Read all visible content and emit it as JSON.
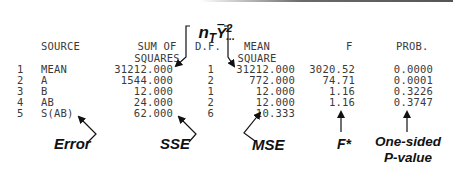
{
  "formula_annotation": {
    "text_main": "n",
    "subscript": "T",
    "y": "Y",
    "superscript": "2",
    "dots": "..."
  },
  "table": {
    "headers": {
      "source": "SOURCE",
      "ss_line1": "SUM OF",
      "ss_line2": "SQUARES",
      "df": "D.F.",
      "ms_line1": "MEAN",
      "ms_line2": "SQUARE",
      "f": "F",
      "prob": "PROB."
    },
    "rows": [
      {
        "num": "1",
        "source": "MEAN",
        "ss": "31212.000",
        "df": "1",
        "ms": "31212.000",
        "f": "3020.52",
        "prob": "0.0000"
      },
      {
        "num": "2",
        "source": "A",
        "ss": "1544.000",
        "df": "2",
        "ms": "772.000",
        "f": "74.71",
        "prob": "0.0001"
      },
      {
        "num": "3",
        "source": "B",
        "ss": "12.000",
        "df": "1",
        "ms": "12.000",
        "f": "1.16",
        "prob": "0.3226"
      },
      {
        "num": "4",
        "source": "AB",
        "ss": "24.000",
        "df": "2",
        "ms": "12.000",
        "f": "1.16",
        "prob": "0.3747"
      },
      {
        "num": "5",
        "source": "S(AB)",
        "ss": "62.000",
        "df": "6",
        "ms": "10.333",
        "f": "",
        "prob": ""
      }
    ]
  },
  "annotations": {
    "error": "Error",
    "sse": "SSE",
    "mse": "MSE",
    "fstar": "F*",
    "pvalue_line1": "One-sided",
    "pvalue_line2": "P-value"
  }
}
